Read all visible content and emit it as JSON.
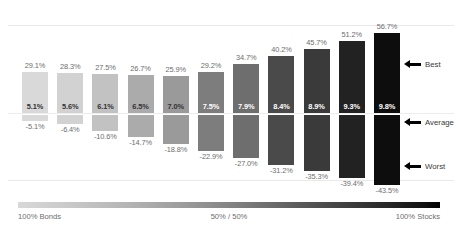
{
  "chart_data": {
    "type": "bar",
    "title": "",
    "subtitle": "",
    "xlabel": "",
    "ylabel": "",
    "grid": true,
    "legend_position": "right",
    "categories": [
      "1",
      "2",
      "3",
      "4",
      "5",
      "6",
      "7",
      "8",
      "9",
      "10",
      "11"
    ],
    "series": [
      {
        "name": "Best",
        "values": [
          29.1,
          28.3,
          27.5,
          26.7,
          25.9,
          29.2,
          34.7,
          40.2,
          45.7,
          51.2,
          56.7
        ]
      },
      {
        "name": "Average",
        "values": [
          5.1,
          5.6,
          6.1,
          6.5,
          7.0,
          7.5,
          7.9,
          8.4,
          8.9,
          9.3,
          9.8
        ]
      },
      {
        "name": "Worst",
        "values": [
          -5.1,
          -6.4,
          -10.6,
          -14.7,
          -18.8,
          -22.9,
          -27.0,
          -31.2,
          -35.3,
          -39.4,
          -43.5
        ]
      }
    ],
    "best_labels": [
      "29.1%",
      "28.3%",
      "27.5%",
      "26.7%",
      "25.9%",
      "29.2%",
      "34.7%",
      "40.2%",
      "45.7%",
      "51.2%",
      "56.7%"
    ],
    "average_labels": [
      "5.1%",
      "5.6%",
      "6.1%",
      "6.5%",
      "7.0%",
      "7.5%",
      "7.9%",
      "8.4%",
      "8.9%",
      "9.3%",
      "9.8%"
    ],
    "worst_labels": [
      "-5.1%",
      "-6.4%",
      "-10.6%",
      "-14.7%",
      "-18.8%",
      "-22.9%",
      "-27.0%",
      "-31.2%",
      "-35.3%",
      "-39.4%",
      "-43.5%"
    ],
    "bar_colors": [
      "#d9d9d9",
      "#d2d2d2",
      "#c2c2c2",
      "#ababab",
      "#9a9a9a",
      "#7d7d7d",
      "#6e6e6e",
      "#4a4a4a",
      "#3a3a3a",
      "#222222",
      "#0d0d0d"
    ],
    "ylim": [
      -50,
      62
    ]
  },
  "scale": {
    "left_label": "100% Bonds",
    "mid_label": "50% / 50%",
    "right_label": "100% Stocks"
  },
  "annotations": {
    "best": "Best",
    "average": "Average",
    "worst": "Worst"
  },
  "colors": {
    "background": "#ffffff",
    "gridline": "#e9e9e9",
    "label_text": "#6d6d6d",
    "annotation_text": "#3a3a3a",
    "avg_label_dark_bg": "#ffffff",
    "avg_label_light_bg": "#333333"
  }
}
